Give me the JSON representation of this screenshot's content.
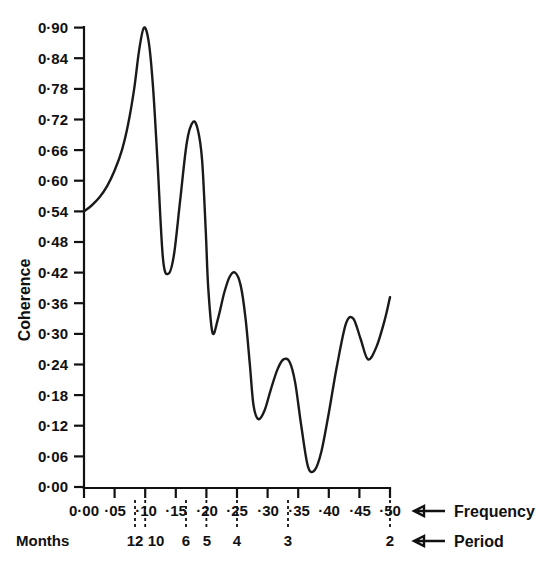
{
  "chart_data": {
    "type": "line",
    "title": "",
    "xlabel": "Frequency",
    "ylabel": "Coherence",
    "xlim": [
      0.0,
      0.5
    ],
    "ylim": [
      0.0,
      0.9
    ],
    "grid": false,
    "legend": null,
    "y_ticks": [
      "0·90",
      "0·84",
      "0·78",
      "0·72",
      "0·66",
      "0·60",
      "0·54",
      "0·48",
      "0·42",
      "0·36",
      "0·30",
      "0·24",
      "0·18",
      "0·12",
      "0·06",
      "0·00"
    ],
    "y_tick_values": [
      0.9,
      0.84,
      0.78,
      0.72,
      0.66,
      0.6,
      0.54,
      0.48,
      0.42,
      0.36,
      0.3,
      0.24,
      0.18,
      0.12,
      0.06,
      0.0
    ],
    "x_ticks": [
      "0·00",
      "·05",
      "·10",
      "·15",
      "·20",
      "·25",
      "·30",
      "·35",
      "·40",
      "·45",
      "·50"
    ],
    "x_tick_values": [
      0.0,
      0.05,
      0.1,
      0.15,
      0.2,
      0.25,
      0.3,
      0.35,
      0.4,
      0.45,
      0.5
    ],
    "period_axis_label": "Period",
    "frequency_axis_label": "Frequency",
    "period_row_title": "Months",
    "period_ticks": [
      {
        "label": "12",
        "frequency": 0.0833
      },
      {
        "label": "10",
        "frequency": 0.1
      },
      {
        "label": "6",
        "frequency": 0.1667
      },
      {
        "label": "5",
        "frequency": 0.2
      },
      {
        "label": "4",
        "frequency": 0.25
      },
      {
        "label": "3",
        "frequency": 0.3333
      },
      {
        "label": "2",
        "frequency": 0.5
      }
    ],
    "series": [
      {
        "name": "Coherence",
        "x": [
          0.0,
          0.012,
          0.025,
          0.038,
          0.05,
          0.062,
          0.072,
          0.082,
          0.09,
          0.098,
          0.106,
          0.113,
          0.12,
          0.129,
          0.138,
          0.147,
          0.157,
          0.168,
          0.178,
          0.186,
          0.193,
          0.199,
          0.203,
          0.21,
          0.219,
          0.229,
          0.238,
          0.247,
          0.256,
          0.264,
          0.271,
          0.277,
          0.285,
          0.295,
          0.305,
          0.316,
          0.326,
          0.336,
          0.345,
          0.355,
          0.366,
          0.377,
          0.388,
          0.4,
          0.413,
          0.428,
          0.44,
          0.452,
          0.464,
          0.478,
          0.492,
          0.5
        ],
        "y": [
          0.54,
          0.551,
          0.567,
          0.59,
          0.62,
          0.66,
          0.71,
          0.78,
          0.855,
          0.9,
          0.87,
          0.78,
          0.64,
          0.448,
          0.418,
          0.455,
          0.56,
          0.675,
          0.715,
          0.7,
          0.64,
          0.5,
          0.39,
          0.302,
          0.33,
          0.38,
          0.412,
          0.42,
          0.395,
          0.33,
          0.24,
          0.16,
          0.133,
          0.15,
          0.19,
          0.23,
          0.25,
          0.245,
          0.205,
          0.12,
          0.04,
          0.033,
          0.07,
          0.145,
          0.235,
          0.32,
          0.33,
          0.29,
          0.25,
          0.275,
          0.33,
          0.372
        ]
      }
    ],
    "annotations": [
      {
        "text": "Frequency",
        "role": "axis-row-callout"
      },
      {
        "text": "Period",
        "role": "axis-row-callout"
      },
      {
        "text": "Months",
        "role": "period-row-title"
      }
    ]
  }
}
